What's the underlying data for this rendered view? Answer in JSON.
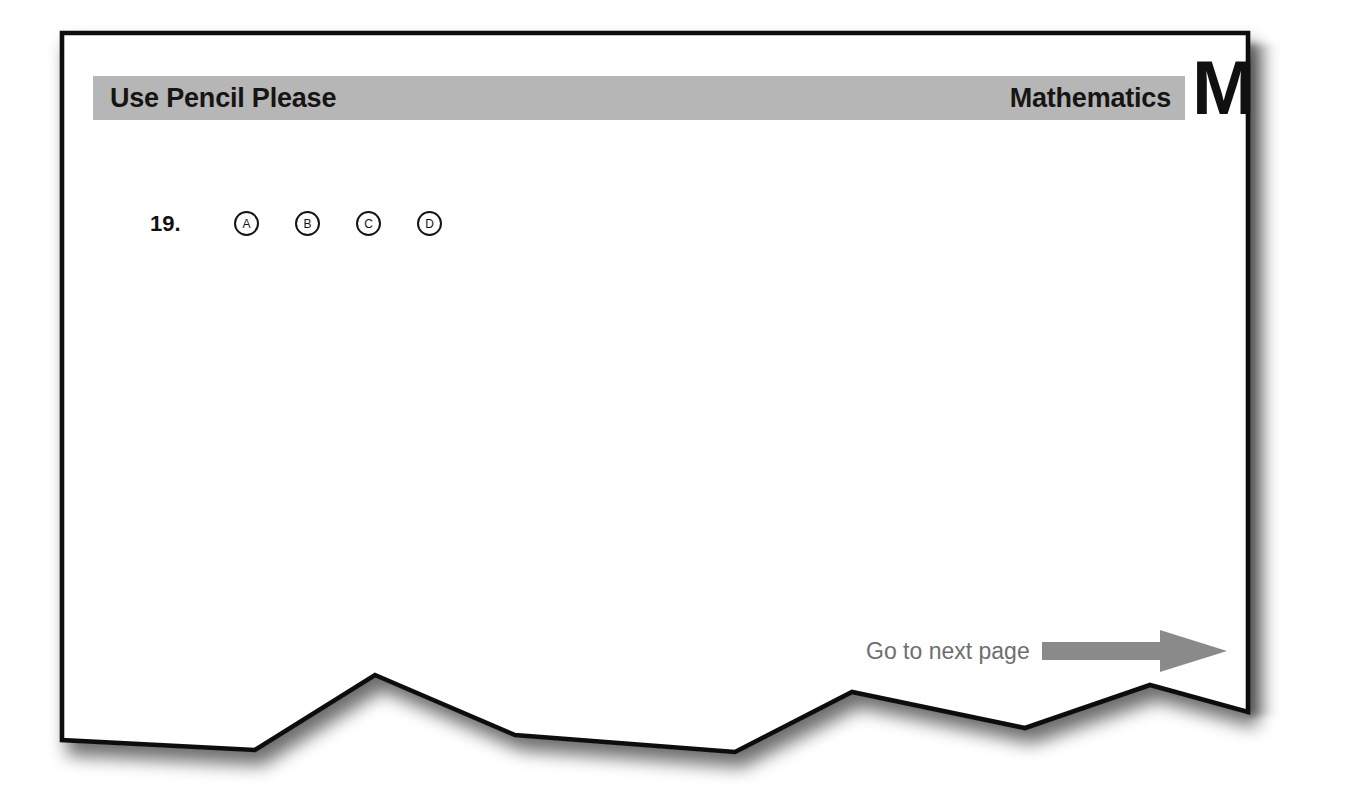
{
  "page": {
    "kind": "standardized-test-answer-sheet",
    "background_color": "#ffffff",
    "paper_color": "#ffffff",
    "border_color": "#111111",
    "accent_gray": "#b6b6b6",
    "muted_text_color": "#6e6e6e"
  },
  "header": {
    "instruction": "Use Pencil Please",
    "subject": "Mathematics",
    "subject_letter": "M",
    "bar_color": "#b6b6b6"
  },
  "questions": [
    {
      "number": "19.",
      "options": [
        "A",
        "B",
        "C",
        "D"
      ]
    }
  ],
  "footer": {
    "next_page_label": "Go to next page",
    "arrow_color": "#8a8a8a"
  },
  "torn_edge": {
    "description": "jagged torn bottom edge of the sheet",
    "points": "62,740 255,750 375,675 515,735 735,752 852,692 1025,728 1150,685 1248,712"
  }
}
